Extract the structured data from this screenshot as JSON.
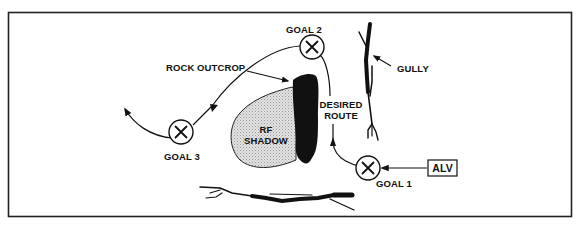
{
  "diagram": {
    "type": "route-planning-diagram",
    "labels": {
      "goal_1": "GOAL 1",
      "goal_2": "GOAL 2",
      "goal_3": "GOAL 3",
      "rock_outcrop": "ROCK OUTCROP",
      "gully": "GULLY",
      "rf_shadow_line1": "RF",
      "rf_shadow_line2": "SHADOW",
      "desired_route_line1": "DESIRED",
      "desired_route_line2": "ROUTE",
      "vehicle": "ALV"
    },
    "goals": [
      {
        "id": "goal-1",
        "label": "GOAL 1",
        "cx": 368,
        "cy": 168
      },
      {
        "id": "goal-2",
        "label": "GOAL 2",
        "cx": 312,
        "cy": 47
      },
      {
        "id": "goal-3",
        "label": "GOAL 3",
        "cx": 181,
        "cy": 132
      }
    ],
    "colors": {
      "ink": "#111111",
      "shadow_fill": "#cfcfcf",
      "background": "#ffffff"
    }
  }
}
